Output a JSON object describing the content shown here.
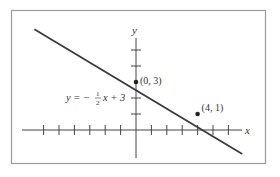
{
  "chart_data": {
    "type": "line",
    "title": "",
    "xlabel": "x",
    "ylabel": "y",
    "equation": "y = −½x + 3",
    "equation_parts": {
      "lhs": "y = −",
      "num": "1",
      "den": "2",
      "rhs": "x + 3"
    },
    "slope": -0.5,
    "intercept": 3,
    "xlim": [
      -7.5,
      7.2
    ],
    "ylim": [
      -2.1,
      6.5
    ],
    "x_ticks": [
      -6,
      -5,
      -4,
      -3,
      -2,
      -1,
      1,
      2,
      3,
      4,
      5,
      6
    ],
    "y_ticks": [
      1,
      2,
      4,
      5
    ],
    "points": [
      {
        "x": 0,
        "y": 3,
        "label": "(0, 3)"
      },
      {
        "x": 4,
        "y": 1,
        "label": "(4, 1)"
      }
    ],
    "line_endpoints": [
      {
        "x": -6.6,
        "y": 6.3
      },
      {
        "x": 6.9,
        "y": -1.5
      }
    ],
    "grid": false,
    "legend": "none"
  },
  "colors": {
    "frame": "#9a9a9a",
    "axis": "#444444",
    "line": "#3a3a3a",
    "text": "#333333"
  }
}
